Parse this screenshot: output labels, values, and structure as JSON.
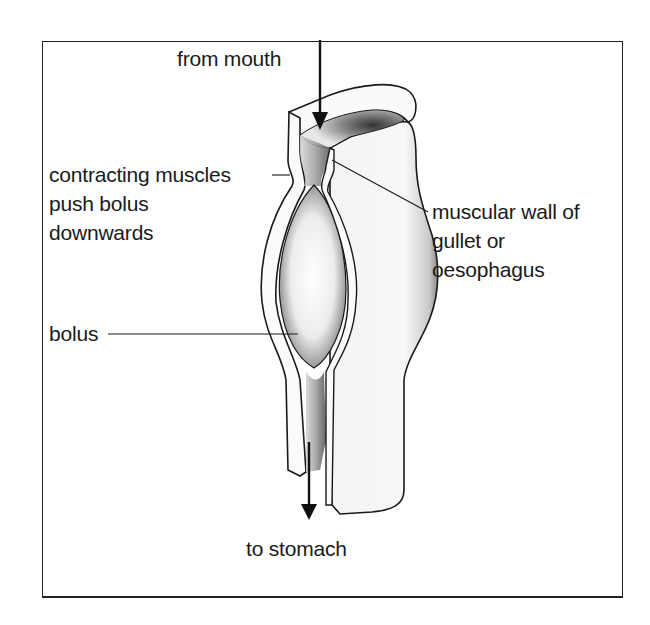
{
  "diagram": {
    "labels": {
      "from_mouth": "from mouth",
      "contracting_1": "contracting muscles",
      "contracting_2": "push bolus",
      "contracting_3": "downwards",
      "wall_1": "muscular wall of",
      "wall_2": "gullet or",
      "wall_3": "oesophagus",
      "bolus": "bolus",
      "to_stomach": "to stomach"
    },
    "arrows": [
      {
        "name": "from-mouth-arrow",
        "direction": "down"
      },
      {
        "name": "to-stomach-arrow",
        "direction": "down"
      }
    ],
    "colors": {
      "ink": "#1a1a1a",
      "background": "#ffffff",
      "shading": "#8a8a8a"
    }
  }
}
